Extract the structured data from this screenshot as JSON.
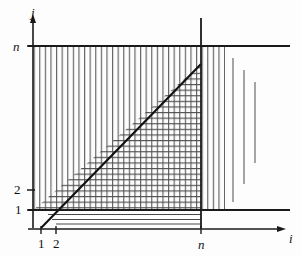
{
  "figure": {
    "background_color": "#fdfdfd",
    "ink_color": "#1a1a1a",
    "hatch_color": "#555555",
    "axes": {
      "x_axis_label": "i",
      "y_axis_label": "j"
    },
    "x_ticks": [
      {
        "label": "1",
        "value": 1
      },
      {
        "label": "2",
        "value": 2
      },
      {
        "label": "n",
        "value": 20
      }
    ],
    "y_ticks": [
      {
        "label": "1",
        "value": 1
      },
      {
        "label": "2",
        "value": 2
      },
      {
        "label": "n",
        "value": 20
      }
    ],
    "diagonal": {
      "description": "line j = i",
      "from": [
        1,
        1
      ],
      "to": [
        20,
        20
      ]
    },
    "regions": [
      {
        "name": "vertical-hatched-band",
        "hatch": "vertical",
        "description": "band 1 <= j <= n spanning all drawn i"
      },
      {
        "name": "cross-hatched-triangle",
        "hatch": "cross",
        "description": "triangle 1 <= j <= i <= n below the diagonal"
      },
      {
        "name": "lower-strip",
        "hatch": "horizontal",
        "description": "thin strip below j = 1"
      }
    ],
    "trailing_marks": {
      "count": 3,
      "description": "three isolated shortening vertical strokes at right indicating continuation"
    }
  }
}
